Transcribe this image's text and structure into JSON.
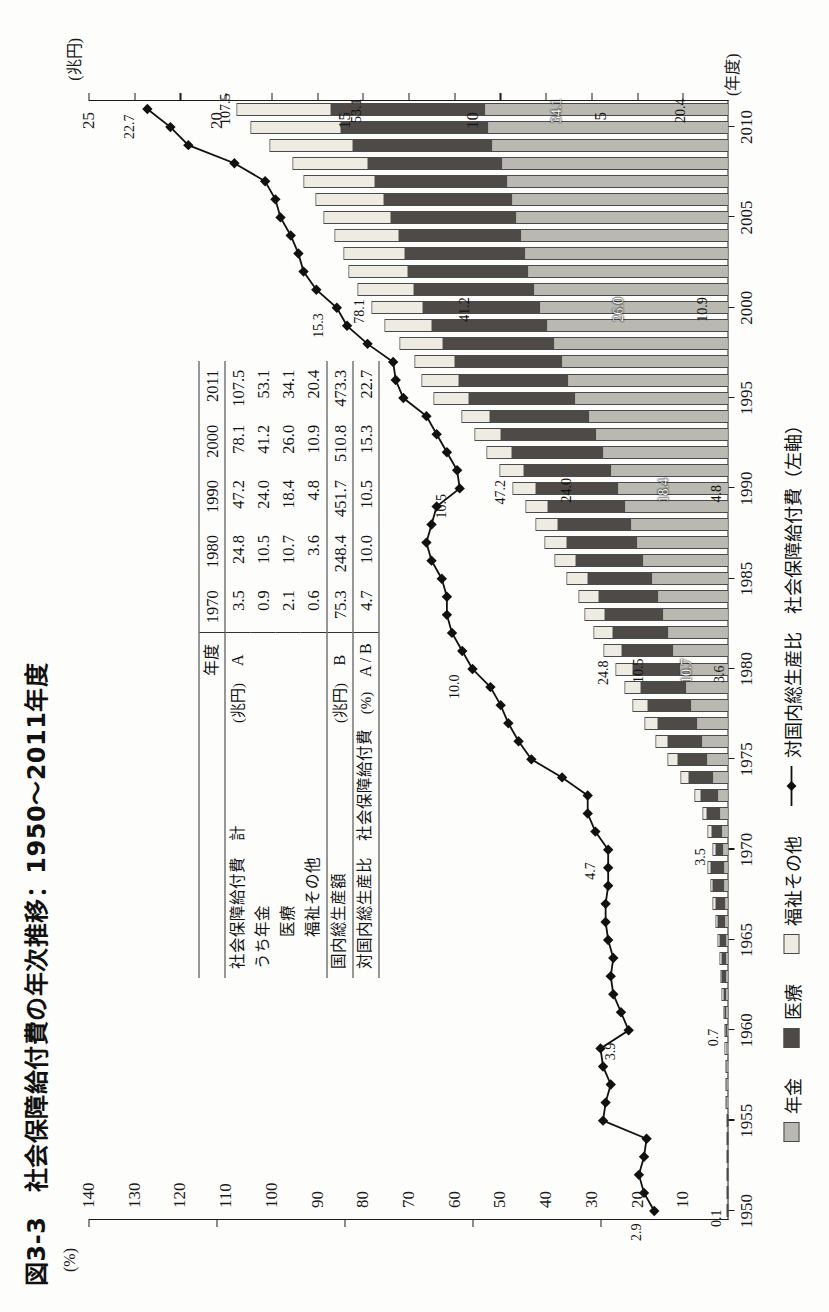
{
  "figure": {
    "title": "図3-3　社会保障給付費の年次推移：1950～2011年度",
    "left_axis_unit": "(%)",
    "right_axis_unit": "(兆円)",
    "x_axis_unit": "(年度)"
  },
  "axes": {
    "left_ticks": [
      "25",
      "20",
      "15",
      "10",
      "5"
    ],
    "right_ticks": [
      "140",
      "130",
      "120",
      "110",
      "100",
      "90",
      "80",
      "70",
      "60",
      "50",
      "40",
      "30",
      "20",
      "10"
    ],
    "x_ticks": [
      "1950",
      "1955",
      "1960",
      "1965",
      "1970",
      "1975",
      "1980",
      "1985",
      "1990",
      "1995",
      "2000",
      "2005",
      "2010"
    ]
  },
  "legend": {
    "items": [
      {
        "label": "年金",
        "swatch": "sw-pension",
        "color": "#b9b9b1"
      },
      {
        "label": "医療",
        "swatch": "sw-medical",
        "color": "#4d4a47"
      },
      {
        "label": "福祉その他",
        "swatch": "sw-welfare",
        "color": "#edebe2"
      }
    ],
    "line_label": "対国内総生産比　社会保障給付費（左軸）"
  },
  "annotations": {
    "bar_totals": [
      {
        "year": 1950,
        "text": "0.1"
      },
      {
        "year": 1960,
        "text": "0.7"
      },
      {
        "year": 1970,
        "text": "3.5"
      },
      {
        "year": 1980,
        "text": "24.8"
      },
      {
        "year": 1990,
        "text": "47.2"
      },
      {
        "year": 2000,
        "text": "78.1"
      },
      {
        "year": 2011,
        "text": "107.5"
      }
    ],
    "segment_labels": [
      {
        "year": 1980,
        "pension": "10.5",
        "medical": "10.7",
        "welfare": "3.6"
      },
      {
        "year": 1990,
        "pension": "24.0",
        "medical": "18.4",
        "welfare": "4.8"
      },
      {
        "year": 2000,
        "pension": "41.2",
        "medical": "26.0",
        "welfare": "10.9"
      },
      {
        "year": 2011,
        "pension": "53.1",
        "medical": "34.1",
        "welfare": "20.4"
      }
    ],
    "line_labels": [
      {
        "year": 1950,
        "text": "2.9"
      },
      {
        "year": 1960,
        "text": "3.9"
      },
      {
        "year": 1970,
        "text": "4.7"
      },
      {
        "year": 1980,
        "text": "10.0"
      },
      {
        "year": 1990,
        "text": "10.5"
      },
      {
        "year": 2000,
        "text": "15.3"
      },
      {
        "year": 2011,
        "text": "22.7"
      }
    ]
  },
  "table": {
    "corner_label": "年度",
    "year_columns": [
      "1970",
      "1980",
      "1990",
      "2000",
      "2011"
    ],
    "rows": [
      {
        "label": "社会保障給付費　計",
        "unit": "(兆円)",
        "code": "A",
        "values": [
          "3.5",
          "24.8",
          "47.2",
          "78.1",
          "107.5"
        ]
      },
      {
        "label": "うち年金",
        "unit": "",
        "code": "",
        "values": [
          "0.9",
          "10.5",
          "24.0",
          "41.2",
          "53.1"
        ]
      },
      {
        "label": "　　医療",
        "unit": "",
        "code": "",
        "values": [
          "2.1",
          "10.7",
          "18.4",
          "26.0",
          "34.1"
        ]
      },
      {
        "label": "　　福祉その他",
        "unit": "",
        "code": "",
        "values": [
          "0.6",
          "3.6",
          "4.8",
          "10.9",
          "20.4"
        ]
      },
      {
        "label": "国内総生産額",
        "unit": "(兆円)",
        "code": "B",
        "values": [
          "75.3",
          "248.4",
          "451.7",
          "510.8",
          "473.3"
        ]
      },
      {
        "label": "対国内総生産比　社会保障給付費",
        "unit": "(%)",
        "code": "A / B",
        "values": [
          "4.7",
          "10.0",
          "10.5",
          "15.3",
          "22.7"
        ]
      }
    ]
  },
  "chart_data": {
    "type": "bar",
    "title": "図3-3　社会保障給付費の年次推移：1950～2011年度",
    "xlabel": "(年度)",
    "ylabel": "(兆円)",
    "y2label": "(%)",
    "ylim": [
      0,
      140
    ],
    "y2lim": [
      0,
      25
    ],
    "grid": false,
    "legend_position": "bottom",
    "x": [
      1950,
      1951,
      1952,
      1953,
      1954,
      1955,
      1956,
      1957,
      1958,
      1959,
      1960,
      1961,
      1962,
      1963,
      1964,
      1965,
      1966,
      1967,
      1968,
      1969,
      1970,
      1971,
      1972,
      1973,
      1974,
      1975,
      1976,
      1977,
      1978,
      1979,
      1980,
      1981,
      1982,
      1983,
      1984,
      1985,
      1986,
      1987,
      1988,
      1989,
      1990,
      1991,
      1992,
      1993,
      1994,
      1995,
      1996,
      1997,
      1998,
      1999,
      2000,
      2001,
      2002,
      2003,
      2004,
      2005,
      2006,
      2007,
      2008,
      2009,
      2010,
      2011
    ],
    "series": [
      {
        "name": "年金",
        "color": "#b9b9b1",
        "values": [
          0.0,
          0.0,
          0.0,
          0.0,
          0.0,
          0.1,
          0.1,
          0.1,
          0.1,
          0.1,
          0.1,
          0.2,
          0.2,
          0.3,
          0.3,
          0.4,
          0.5,
          0.6,
          0.7,
          0.8,
          0.9,
          1.2,
          1.6,
          2.2,
          3.3,
          4.5,
          5.6,
          6.8,
          8.0,
          9.2,
          10.5,
          11.9,
          13.1,
          14.2,
          15.3,
          16.7,
          18.5,
          20.0,
          21.3,
          22.6,
          24.0,
          25.7,
          27.3,
          28.8,
          30.5,
          33.5,
          35.0,
          36.4,
          38.0,
          39.6,
          41.2,
          42.5,
          43.8,
          44.5,
          45.3,
          46.3,
          47.3,
          48.3,
          49.5,
          51.7,
          52.4,
          53.1
        ]
      },
      {
        "name": "医療",
        "color": "#4d4a47",
        "values": [
          0.1,
          0.1,
          0.2,
          0.2,
          0.3,
          0.3,
          0.4,
          0.4,
          0.5,
          0.6,
          0.7,
          0.9,
          1.1,
          1.3,
          1.5,
          1.8,
          2.1,
          2.5,
          2.9,
          3.3,
          2.1,
          2.6,
          3.3,
          4.1,
          5.6,
          6.9,
          8.0,
          9.0,
          9.9,
          10.3,
          10.7,
          11.6,
          12.4,
          13.1,
          13.3,
          14.3,
          15.1,
          15.7,
          16.2,
          17.2,
          18.4,
          19.4,
          20.4,
          21.2,
          22.0,
          23.6,
          24.2,
          23.8,
          24.7,
          25.5,
          26.0,
          26.5,
          26.5,
          26.6,
          27.1,
          27.8,
          28.3,
          29.2,
          29.6,
          30.8,
          32.7,
          34.1
        ]
      },
      {
        "name": "福祉その他",
        "color": "#edebe2",
        "values": [
          0.0,
          0.0,
          0.0,
          0.0,
          0.0,
          0.1,
          0.1,
          0.1,
          0.1,
          0.1,
          0.1,
          0.1,
          0.2,
          0.2,
          0.2,
          0.3,
          0.3,
          0.4,
          0.4,
          0.5,
          0.6,
          0.7,
          0.9,
          1.1,
          1.5,
          2.0,
          2.3,
          2.6,
          3.0,
          3.3,
          3.6,
          3.8,
          4.0,
          4.2,
          4.3,
          4.4,
          4.5,
          4.6,
          4.7,
          4.7,
          4.8,
          5.0,
          5.3,
          5.5,
          5.9,
          7.4,
          8.0,
          8.5,
          9.3,
          10.1,
          10.9,
          12.1,
          12.8,
          13.2,
          13.8,
          14.6,
          14.7,
          15.4,
          16.2,
          18.0,
          19.4,
          20.4
        ]
      }
    ],
    "totals": [
      0.1,
      0.1,
      0.2,
      0.2,
      0.3,
      0.4,
      0.5,
      0.6,
      0.7,
      0.8,
      0.7,
      1.2,
      1.5,
      1.8,
      2.0,
      2.4,
      2.9,
      3.4,
      4.0,
      4.6,
      3.5,
      4.5,
      5.8,
      7.4,
      10.4,
      13.4,
      15.9,
      18.4,
      20.9,
      22.8,
      24.8,
      27.3,
      29.5,
      31.5,
      32.9,
      35.4,
      38.1,
      40.3,
      42.2,
      44.5,
      47.2,
      50.1,
      53.0,
      55.5,
      58.4,
      64.5,
      67.2,
      68.7,
      72.0,
      75.2,
      78.1,
      81.1,
      83.1,
      84.3,
      86.2,
      88.7,
      90.3,
      92.9,
      95.3,
      100.5,
      104.5,
      107.5
    ],
    "line_series": {
      "name": "対国内総生産比　社会保障給付費（左軸）",
      "unit": "%",
      "color": "#111111",
      "values": [
        2.9,
        3.3,
        3.5,
        3.3,
        3.2,
        4.9,
        4.8,
        4.6,
        4.9,
        5.0,
        3.9,
        4.2,
        4.5,
        4.6,
        4.5,
        4.7,
        4.8,
        4.8,
        4.7,
        4.7,
        4.7,
        5.2,
        5.5,
        5.5,
        6.5,
        7.7,
        8.2,
        8.6,
        8.9,
        9.3,
        10.0,
        10.4,
        10.8,
        11.0,
        11.0,
        11.2,
        11.6,
        11.8,
        11.6,
        11.4,
        10.5,
        10.6,
        11.0,
        11.4,
        11.8,
        12.7,
        13.0,
        13.1,
        14.1,
        14.9,
        15.3,
        16.1,
        16.6,
        16.8,
        17.1,
        17.5,
        17.7,
        18.1,
        19.3,
        21.1,
        21.8,
        22.7
      ]
    }
  }
}
